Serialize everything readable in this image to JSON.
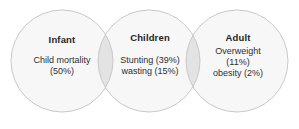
{
  "diagram": {
    "type": "venn",
    "title": "",
    "background_color": "#ffffff",
    "circle_fill": "#f7f7f7",
    "circle_stroke": "#c9c9c9",
    "overlap_fill": "#e3e3e3",
    "text_color": "#2b2b2b",
    "groups": [
      {
        "id": "infant",
        "heading": "Infant",
        "lines": [
          "Child mortality",
          "(50%)"
        ],
        "cx": 62,
        "cy": 61,
        "r": 51
      },
      {
        "id": "children",
        "heading": "Children",
        "lines": [
          "Stunting (39%)",
          "wasting (15%)"
        ],
        "cx": 149,
        "cy": 61,
        "r": 51
      },
      {
        "id": "adult",
        "heading": "Adult",
        "lines": [
          "Overweight",
          "(11%)",
          "obesity (2%)"
        ],
        "cx": 237,
        "cy": 61,
        "r": 51
      }
    ]
  }
}
